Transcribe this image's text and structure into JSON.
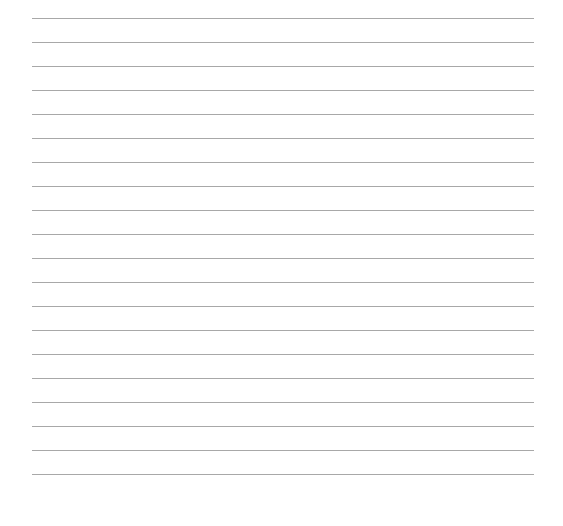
{
  "page": {
    "type": "lined-paper",
    "line_count": 20,
    "line_color": "#a8a8a8",
    "background": "#ffffff",
    "first_line_y": 18,
    "line_spacing": 24,
    "line_left": 32,
    "line_right": 534
  }
}
